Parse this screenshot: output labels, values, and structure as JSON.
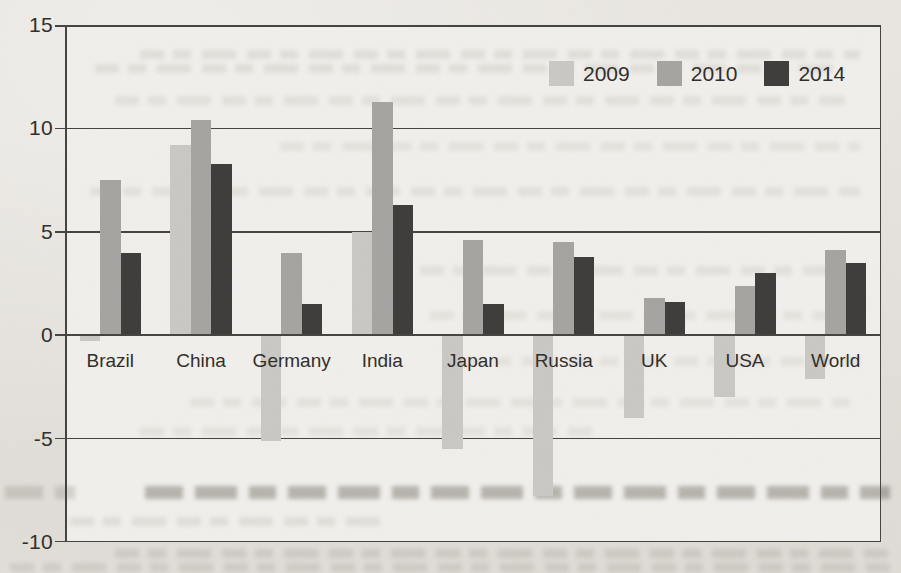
{
  "colors": {
    "paper": "#e9e6e1",
    "plot_background": "#f1efeb",
    "axis_line": "#45433f",
    "text": "#2f2d2a"
  },
  "chart_data": {
    "type": "bar",
    "title": "",
    "xlabel": "",
    "ylabel": "",
    "categories": [
      "Brazil",
      "China",
      "Germany",
      "India",
      "Japan",
      "Russia",
      "UK",
      "USA",
      "World"
    ],
    "series": [
      {
        "name": "2009",
        "color": "#c9c8c4",
        "values": [
          -0.3,
          9.2,
          -5.1,
          5.0,
          -5.5,
          -7.8,
          -4.0,
          -3.0,
          -2.1
        ]
      },
      {
        "name": "2010",
        "color": "#a5a4a0",
        "values": [
          7.5,
          10.4,
          4.0,
          11.3,
          4.6,
          4.5,
          1.8,
          2.4,
          4.1
        ]
      },
      {
        "name": "2014",
        "color": "#3d3c3a",
        "values": [
          4.0,
          8.3,
          1.5,
          6.3,
          1.5,
          3.8,
          1.6,
          3.0,
          3.5
        ]
      }
    ],
    "ylim": [
      -10,
      15
    ],
    "yticks": [
      15,
      10,
      5,
      0,
      -5,
      -10
    ],
    "ytick_labels": [
      "15",
      "10",
      "5",
      "0",
      "-5",
      "-10"
    ],
    "grid": "horizontal gridlines at each y tick",
    "legend_position": "top-right inside plot area"
  }
}
